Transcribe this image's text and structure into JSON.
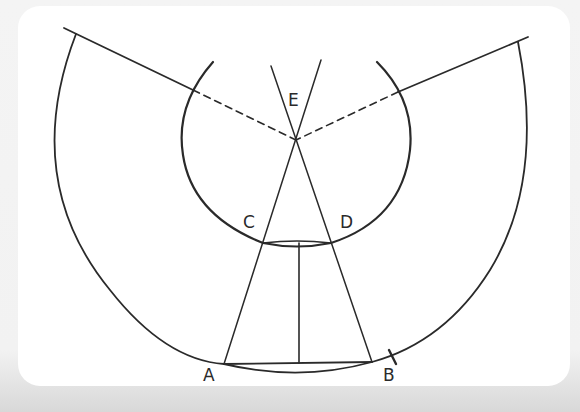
{
  "diagram": {
    "type": "geometric-construction",
    "points": {
      "A": {
        "label": "A",
        "x": 224,
        "y": 364
      },
      "B": {
        "label": "B",
        "x": 372,
        "y": 362
      },
      "C": {
        "label": "C",
        "x": 263,
        "y": 243
      },
      "D": {
        "label": "D",
        "x": 331,
        "y": 243
      },
      "E": {
        "label": "E",
        "x": 296,
        "y": 140
      }
    },
    "labels": {
      "A": "A",
      "B": "B",
      "C": "C",
      "D": "D",
      "E": "E"
    },
    "colors": {
      "stroke": "#2a2a2a",
      "page": "#ffffff",
      "background": "#e8e8e8"
    }
  }
}
